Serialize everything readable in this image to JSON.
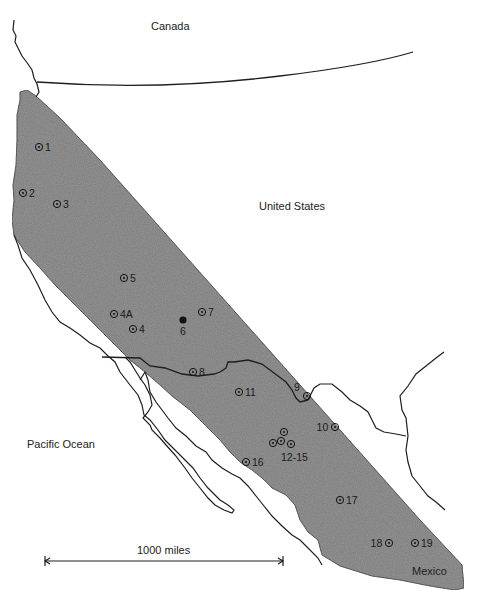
{
  "map": {
    "regions": {
      "canada": "Canada",
      "united_states": "United States",
      "pacific_ocean": "Pacific Ocean",
      "mexico": "Mexico"
    },
    "scale_bar": {
      "label": "1000 miles"
    },
    "colors": {
      "band_fill": "#7d7d7d",
      "line": "#1e1e1e",
      "background": "#ffffff"
    },
    "sites": [
      {
        "id": "1",
        "label": "1",
        "x": 39,
        "y": 147,
        "label_side": "right",
        "type": "open"
      },
      {
        "id": "2",
        "label": "2",
        "x": 23,
        "y": 193,
        "label_side": "right",
        "type": "open"
      },
      {
        "id": "3",
        "label": "3",
        "x": 57,
        "y": 204,
        "label_side": "right",
        "type": "open"
      },
      {
        "id": "5",
        "label": "5",
        "x": 124,
        "y": 278,
        "label_side": "right",
        "type": "open"
      },
      {
        "id": "4A",
        "label": "4A",
        "x": 114,
        "y": 314,
        "label_side": "right",
        "type": "open"
      },
      {
        "id": "4",
        "label": "4",
        "x": 133,
        "y": 329,
        "label_side": "right",
        "type": "open"
      },
      {
        "id": "6",
        "label": "6",
        "x": 183,
        "y": 320,
        "label_side": "below",
        "type": "filled"
      },
      {
        "id": "7",
        "label": "7",
        "x": 202,
        "y": 312,
        "label_side": "right",
        "type": "open"
      },
      {
        "id": "8",
        "label": "8",
        "x": 193,
        "y": 372,
        "label_side": "right",
        "type": "open"
      },
      {
        "id": "9",
        "label": "9",
        "x": 307,
        "y": 396,
        "label_side": "left-up",
        "type": "open"
      },
      {
        "id": "10",
        "label": "10",
        "x": 335,
        "y": 427,
        "label_side": "left",
        "type": "open"
      },
      {
        "id": "11",
        "label": "11",
        "x": 239,
        "y": 392,
        "label_side": "right",
        "type": "open"
      },
      {
        "id": "12",
        "label": "",
        "x": 273,
        "y": 443,
        "label_side": "none",
        "type": "open"
      },
      {
        "id": "13",
        "label": "",
        "x": 281,
        "y": 441,
        "label_side": "none",
        "type": "open"
      },
      {
        "id": "14",
        "label": "",
        "x": 284,
        "y": 432,
        "label_side": "none",
        "type": "open"
      },
      {
        "id": "15",
        "label": "",
        "x": 291,
        "y": 444,
        "label_side": "none",
        "type": "open"
      },
      {
        "id": "16",
        "label": "16",
        "x": 246,
        "y": 462,
        "label_side": "right",
        "type": "open"
      },
      {
        "id": "17",
        "label": "17",
        "x": 340,
        "y": 500,
        "label_side": "right",
        "type": "open"
      },
      {
        "id": "18",
        "label": "18",
        "x": 389,
        "y": 543,
        "label_side": "left",
        "type": "open"
      },
      {
        "id": "19",
        "label": "19",
        "x": 415,
        "y": 543,
        "label_side": "right",
        "type": "open"
      }
    ],
    "group_labels": [
      {
        "id": "12-15",
        "label": "12-15",
        "x": 281,
        "y": 457
      }
    ]
  }
}
